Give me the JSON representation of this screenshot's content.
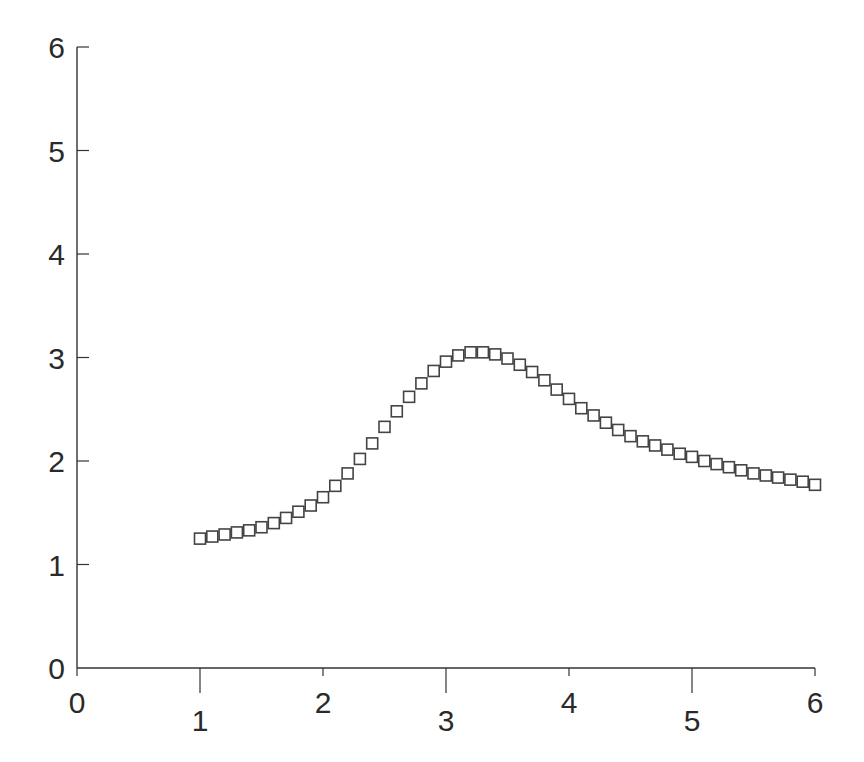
{
  "chart_data": {
    "type": "scatter",
    "title": "",
    "xlabel": "",
    "ylabel": "",
    "xlim": [
      0,
      6
    ],
    "ylim": [
      0,
      6
    ],
    "grid": false,
    "legend": null,
    "marker": "open-square",
    "x_ticks": [
      "0",
      "1",
      "2",
      "3",
      "4",
      "5",
      "6"
    ],
    "y_ticks": [
      "0",
      "1",
      "2",
      "3",
      "4",
      "5",
      "6"
    ],
    "series": [
      {
        "name": "data",
        "x": [
          1.0,
          1.1,
          1.2,
          1.3,
          1.4,
          1.5,
          1.6,
          1.7,
          1.8,
          1.9,
          2.0,
          2.1,
          2.2,
          2.3,
          2.4,
          2.5,
          2.6,
          2.7,
          2.8,
          2.9,
          3.0,
          3.1,
          3.2,
          3.3,
          3.4,
          3.5,
          3.6,
          3.7,
          3.8,
          3.9,
          4.0,
          4.1,
          4.2,
          4.3,
          4.4,
          4.5,
          4.6,
          4.7,
          4.8,
          4.9,
          5.0,
          5.1,
          5.2,
          5.3,
          5.4,
          5.5,
          5.6,
          5.7,
          5.8,
          5.9,
          6.0
        ],
        "y": [
          1.25,
          1.27,
          1.29,
          1.31,
          1.33,
          1.36,
          1.4,
          1.45,
          1.51,
          1.57,
          1.65,
          1.76,
          1.88,
          2.02,
          2.17,
          2.33,
          2.48,
          2.62,
          2.75,
          2.87,
          2.96,
          3.02,
          3.05,
          3.05,
          3.03,
          2.99,
          2.93,
          2.86,
          2.78,
          2.69,
          2.6,
          2.51,
          2.44,
          2.37,
          2.3,
          2.24,
          2.19,
          2.15,
          2.11,
          2.07,
          2.04,
          2.0,
          1.97,
          1.94,
          1.91,
          1.88,
          1.86,
          1.84,
          1.82,
          1.8,
          1.77
        ]
      }
    ]
  },
  "layout": {
    "origin_px": [
      77,
      668
    ],
    "x_unit_px": 123,
    "y_unit_px": 103.5,
    "x_label_offsets": [
      0,
      1,
      0,
      1,
      0,
      1,
      0
    ],
    "marker_size": 11,
    "colors": {
      "axis": "#333333",
      "marker_stroke": "#444444",
      "background": "#ffffff"
    }
  }
}
